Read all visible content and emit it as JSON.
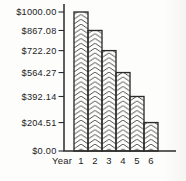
{
  "chart_data": {
    "type": "bar",
    "title": "",
    "xlabel": "Year",
    "ylabel": "",
    "categories": [
      "1",
      "2",
      "3",
      "4",
      "5",
      "6"
    ],
    "values": [
      1000.0,
      867.08,
      722.2,
      564.27,
      392.14,
      204.51
    ],
    "y_ticks": [
      {
        "label": "$1000.00",
        "value": 1000.0
      },
      {
        "label": "$867.08",
        "value": 867.08
      },
      {
        "label": "$722.20",
        "value": 722.2
      },
      {
        "label": "$564.27",
        "value": 564.27
      },
      {
        "label": "$392.14",
        "value": 392.14
      },
      {
        "label": "$204.51",
        "value": 204.51
      },
      {
        "label": "$0.00",
        "value": 0
      }
    ],
    "ylim": [
      0,
      1000
    ],
    "grid": false,
    "legend": null,
    "bar_fill_pattern": "herringbone-hatch",
    "colors": {
      "axis": "#2b2b2b",
      "bar_outline": "#2b2b2b",
      "hatch": "#3d3d3d",
      "text": "#222222",
      "background": "#fdfdfc"
    }
  }
}
